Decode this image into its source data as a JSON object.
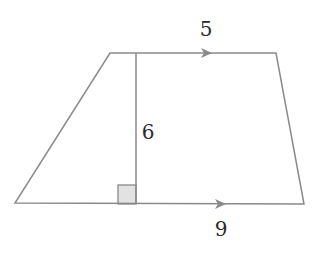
{
  "diagram": {
    "type": "trapezoid",
    "title": "",
    "colors": {
      "stroke": "#8a8a8a",
      "arrow": "#8a8a8a",
      "right_angle_fill": "#e2e2e2",
      "text": "#2a2a2a"
    },
    "vertices": {
      "top_left": [
        110,
        53
      ],
      "top_right": [
        276,
        53
      ],
      "bottom_right": [
        304,
        204
      ],
      "bottom_left": [
        15,
        203
      ]
    },
    "height_line": {
      "x": 136,
      "y_top": 53,
      "y_bottom": 204
    },
    "right_angle_marker": {
      "x": 118,
      "y": 185,
      "size": 18
    },
    "labels": {
      "top_base": "5",
      "height": "6",
      "bottom_base": "9"
    },
    "parallel_marks": [
      {
        "side": "top",
        "tip": [
          212,
          53
        ]
      },
      {
        "side": "bottom",
        "tip": [
          226,
          204
        ]
      }
    ]
  }
}
